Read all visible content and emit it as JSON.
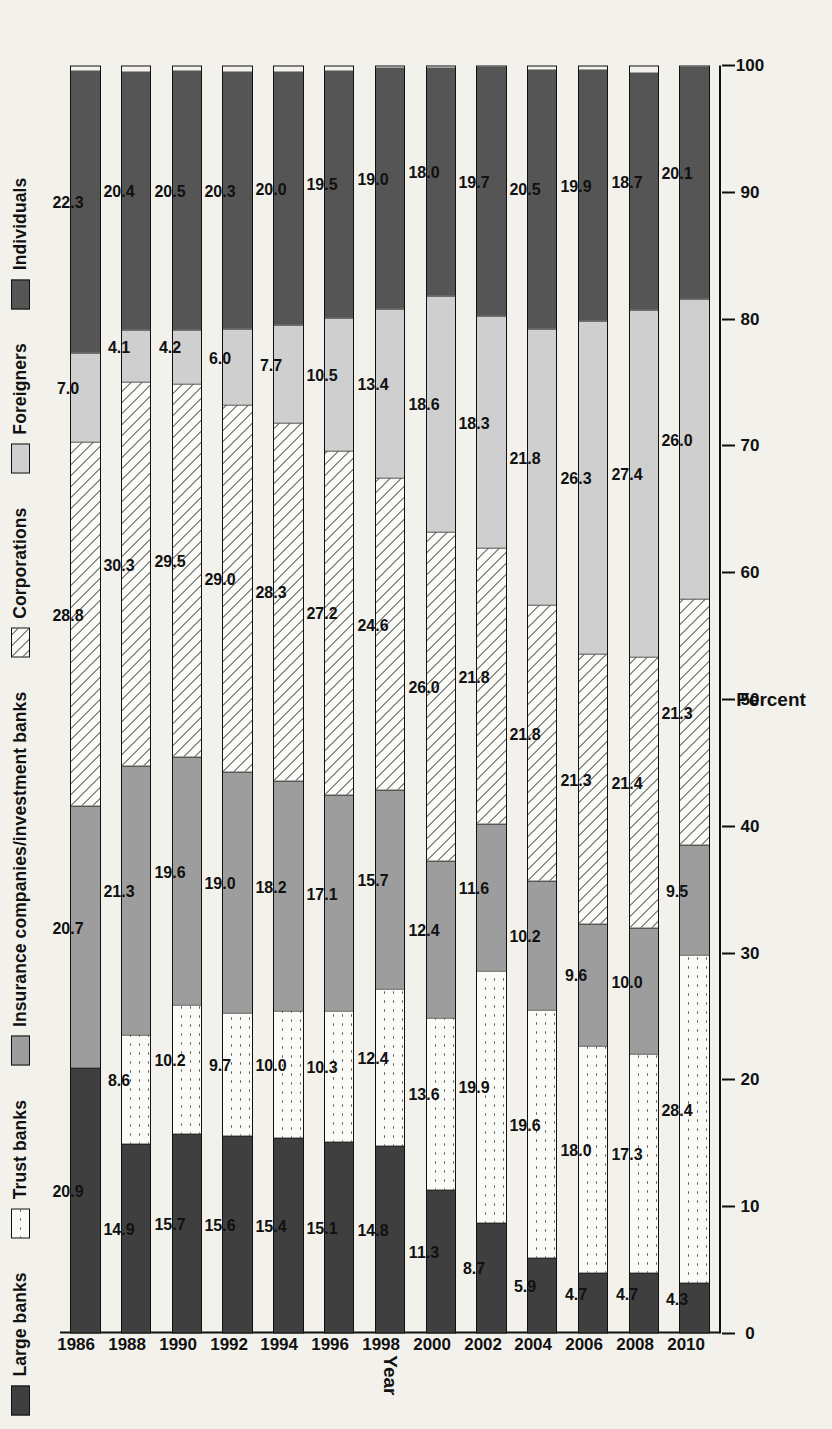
{
  "chart_data": {
    "type": "bar",
    "orientation": "horizontal-stacked",
    "title": "",
    "xlabel": "Percent",
    "ylabel": "Year",
    "xlim": [
      0,
      100
    ],
    "xticks": [
      0,
      10,
      20,
      30,
      40,
      50,
      60,
      70,
      80,
      90,
      100
    ],
    "grid": false,
    "legend_position": "top",
    "categories": [
      "1986",
      "1988",
      "1990",
      "1992",
      "1994",
      "1996",
      "1998",
      "2000",
      "2002",
      "2004",
      "2006",
      "2008",
      "2010"
    ],
    "series": [
      {
        "name": "Large banks",
        "pattern": "solid-dark",
        "color": "#3f3f3f",
        "values": [
          20.9,
          14.9,
          15.7,
          15.6,
          15.4,
          15.1,
          14.8,
          11.3,
          8.7,
          5.9,
          4.7,
          4.7,
          4.3
        ]
      },
      {
        "name": "Trust banks",
        "pattern": "cross-hatch",
        "color": "#fafaf6",
        "values": [
          0.0,
          8.6,
          10.2,
          9.7,
          10.0,
          10.3,
          12.4,
          13.6,
          19.9,
          19.6,
          18.0,
          17.3,
          28.4
        ]
      },
      {
        "name": "Insurance companies/investment banks",
        "pattern": "solid-mid-gray",
        "color": "#9d9d9d",
        "values": [
          20.7,
          21.3,
          19.6,
          19.0,
          18.2,
          17.1,
          15.7,
          12.4,
          11.6,
          10.2,
          9.6,
          10.0,
          9.5
        ]
      },
      {
        "name": "Corporations",
        "pattern": "diagonal-hatch",
        "color": "#fafaf6",
        "values": [
          28.8,
          30.3,
          29.5,
          29.0,
          28.3,
          27.2,
          24.6,
          26.0,
          21.8,
          21.8,
          21.3,
          21.4,
          21.3
        ]
      },
      {
        "name": "Foreigners",
        "pattern": "solid-light-gray",
        "color": "#cfcfcf",
        "values": [
          7.0,
          4.1,
          4.2,
          6.0,
          7.7,
          10.5,
          13.4,
          18.6,
          18.3,
          21.8,
          26.3,
          27.4,
          26.0
        ]
      },
      {
        "name": "Individuals",
        "pattern": "solid-dark-gray",
        "color": "#555555",
        "values": [
          22.3,
          20.4,
          20.5,
          20.3,
          20.0,
          19.5,
          19.0,
          18.0,
          19.7,
          20.5,
          19.9,
          18.7,
          20.1
        ]
      }
    ],
    "value_labels": {
      "1986": [
        "20.9",
        "",
        "20.7",
        "28.8",
        "7.0",
        "22.3"
      ],
      "1988": [
        "14.9",
        "8.6",
        "21.3",
        "30.3",
        "4.1",
        "20.4"
      ],
      "1990": [
        "15.7",
        "10.2",
        "19.6",
        "29.5",
        "4.2",
        "20.5"
      ],
      "1992": [
        "15.6",
        "9.7",
        "19.0",
        "29.0",
        "6.0",
        "20.3"
      ],
      "1994": [
        "15.4",
        "10.0",
        "18.2",
        "28.3",
        "7.7",
        "20.0"
      ],
      "1996": [
        "15.1",
        "10.3",
        "17.1",
        "27.2",
        "10.5",
        "19.5"
      ],
      "1998": [
        "14.8",
        "12.4",
        "15.7",
        "24.6",
        "13.4",
        "19.0"
      ],
      "2000": [
        "11.3",
        "13.6",
        "12.4",
        "26.0",
        "18.6",
        "18.0"
      ],
      "2002": [
        "8.7",
        "19.9",
        "11.6",
        "21.8",
        "18.3",
        "19.7"
      ],
      "2004": [
        "5.9",
        "19.6",
        "10.2",
        "21.8",
        "21.8",
        "20.5"
      ],
      "2006": [
        "4.7",
        "18.0",
        "9.6",
        "21.3",
        "26.3",
        "19.9"
      ],
      "2008": [
        "4.7",
        "17.3",
        "10.0",
        "21.4",
        "27.4",
        "18.7"
      ],
      "2010": [
        "4.3",
        "28.4",
        "9.5",
        "21.3",
        "26.0",
        "20.1"
      ]
    }
  },
  "legend": {
    "items": [
      {
        "label": "Large banks",
        "swatch": "f-large"
      },
      {
        "label": "Trust banks",
        "swatch": "f-trust"
      },
      {
        "label": "Insurance companies/investment banks",
        "swatch": "f-ins"
      },
      {
        "label": "Corporations",
        "swatch": "f-corp"
      },
      {
        "label": "Foreigners",
        "swatch": "f-for"
      },
      {
        "label": "Individuals",
        "swatch": "f-ind"
      }
    ]
  },
  "axes": {
    "x_title": "Percent",
    "y_title": "Year",
    "x_tick_labels": [
      "0",
      "10",
      "20",
      "30",
      "40",
      "50",
      "60",
      "70",
      "80",
      "90",
      "100"
    ]
  }
}
